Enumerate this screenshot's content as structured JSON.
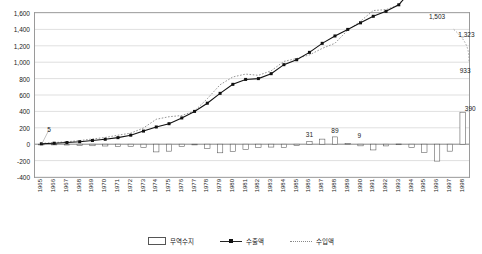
{
  "chart_data": {
    "type": "bar",
    "title": "",
    "xlabel": "",
    "ylabel": "",
    "ylim": [
      -400,
      1600
    ],
    "ytick_step": 200,
    "grid": true,
    "legend_position": "bottom",
    "categories": [
      "1965",
      "1966",
      "1967",
      "1968",
      "1969",
      "1970",
      "1971",
      "1972",
      "1973",
      "1974",
      "1975",
      "1976",
      "1977",
      "1978",
      "1979",
      "1980",
      "1981",
      "1982",
      "1983",
      "1984",
      "1985",
      "1986",
      "1987",
      "1988",
      "1989",
      "1990",
      "1991",
      "1992",
      "1993",
      "1994",
      "1995",
      "1996",
      "1997",
      "1998"
    ],
    "series": [
      {
        "name": "무역수지",
        "type": "bar",
        "values": [
          -5,
          -8,
          -10,
          -14,
          -19,
          -22,
          -30,
          -25,
          -38,
          -94,
          -85,
          -30,
          -5,
          -55,
          -105,
          -90,
          -65,
          -40,
          -35,
          -40,
          -15,
          31,
          62,
          89,
          9,
          -20,
          -70,
          -21,
          2,
          -40,
          -100,
          -206,
          -85,
          390
        ]
      },
      {
        "name": "수출액",
        "type": "line",
        "values": [
          5,
          12,
          20,
          30,
          45,
          60,
          80,
          110,
          160,
          210,
          250,
          320,
          400,
          500,
          620,
          730,
          790,
          800,
          860,
          970,
          1030,
          1120,
          1230,
          1320,
          1400,
          1480,
          1560,
          1620,
          1700,
          1880,
          2150,
          2480,
          2900,
          3000
        ]
      },
      {
        "name": "수입액",
        "type": "line",
        "values": [
          10,
          20,
          30,
          44,
          64,
          82,
          110,
          135,
          198,
          304,
          335,
          350,
          405,
          555,
          725,
          820,
          855,
          840,
          895,
          1010,
          1045,
          1089,
          1168,
          1231,
          1391,
          1500,
          1630,
          1641,
          1698,
          1920,
          2250,
          2686,
          2985,
          2067
        ]
      }
    ],
    "annotations": [
      {
        "label": "5",
        "x": 0.6,
        "y": 185
      },
      {
        "label": "31",
        "x": 21.0,
        "y": 120
      },
      {
        "label": "89",
        "x": 23.0,
        "y": 170
      },
      {
        "label": "9",
        "x": 24.9,
        "y": 112
      },
      {
        "label": "1,503",
        "x": 31.0,
        "y": 1560
      },
      {
        "label": "1,323",
        "x": 33.3,
        "y": 1340
      },
      {
        "label": "933",
        "x": 33.2,
        "y": 905
      },
      {
        "label": "390",
        "x": 33.6,
        "y": 440
      }
    ]
  },
  "axis": {
    "y_ticks": [
      "1,600",
      "1,400",
      "1,200",
      "1,000",
      "800",
      "600",
      "400",
      "200",
      "0",
      "-200",
      "-400"
    ],
    "x_ticks": [
      "1965",
      "1966",
      "1967",
      "1968",
      "1969",
      "1970",
      "1971",
      "1972",
      "1973",
      "1974",
      "1975",
      "1976",
      "1977",
      "1978",
      "1979",
      "1980",
      "1981",
      "1982",
      "1983",
      "1984",
      "1985",
      "1986",
      "1987",
      "1988",
      "1989",
      "1990",
      "1991",
      "1992",
      "1993",
      "1994",
      "1995",
      "1996",
      "1997",
      "1998"
    ]
  },
  "legend": {
    "items": [
      {
        "label": "무역수지",
        "marker": "bar-swatch-icon",
        "color": "#555555"
      },
      {
        "label": "수출액",
        "marker": "line-marker-icon",
        "color": "#111111"
      },
      {
        "label": "수입액",
        "marker": "dotted-line-icon",
        "color": "#888888"
      }
    ]
  },
  "colors": {
    "bar_stroke": "#555555",
    "bar_fill": "#ffffff",
    "export_line": "#111111",
    "import_line": "#8a8a8a",
    "gridline": "#c9c9c9",
    "axis": "#9a9a9a",
    "zero_line": "#777777",
    "text": "#1a1a1a"
  },
  "top_strip": {
    "text": ""
  }
}
